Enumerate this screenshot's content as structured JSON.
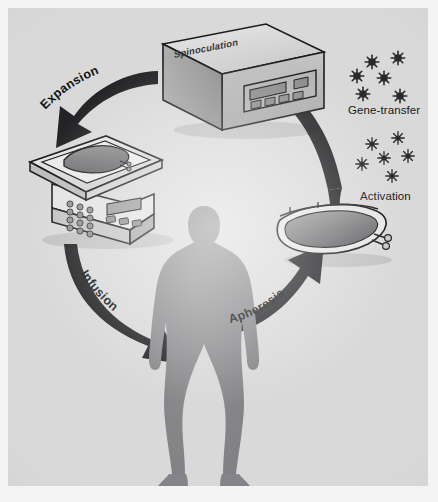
{
  "figure": {
    "background_color": "#d9d9d9",
    "border_color": "#ffffff",
    "ink_color": "#1a1a1c",
    "silhouette_color": "#8a8a8c"
  },
  "steps": [
    {
      "id": "apheresis",
      "label": "Apheresis",
      "order": 1
    },
    {
      "id": "activation",
      "label": "Activation",
      "order": 2
    },
    {
      "id": "gene-transfer",
      "label": "Gene-transfer",
      "order": 3
    },
    {
      "id": "spinoculation",
      "label": "Spinoculation",
      "order": 4
    },
    {
      "id": "expansion",
      "label": "Expansion",
      "order": 5
    },
    {
      "id": "infusion",
      "label": "Infusion",
      "order": 6
    }
  ],
  "labels": {
    "expansion": "Expansion",
    "spinoculation": "Spinoculation",
    "gene_transfer": "Gene-transfer",
    "activation": "Activation",
    "apheresis": "Apheresis",
    "infusion": "Infusion"
  },
  "objects": {
    "centrifuge": {
      "name": "spinoculation-centrifuge",
      "top_label": "Spinoculation",
      "button_count": 4
    },
    "rocker": {
      "name": "rocking-bioreactor",
      "keypad_rows": 4,
      "keypad_cols": 3,
      "button_count": 3
    },
    "culture_bag": {
      "name": "cell-culture-bag",
      "port_count": 2
    },
    "patient": {
      "name": "patient-silhouette"
    }
  },
  "particles": {
    "gene_transfer": {
      "name": "viral-vector-particles",
      "count": 6,
      "glyph": "virus-icon"
    },
    "activation": {
      "name": "activation-bead-particles",
      "count": 6,
      "glyph": "bead-star-icon"
    }
  },
  "arrows": [
    {
      "id": "arrow-apheresis",
      "from": "patient",
      "to": "culture-bag",
      "label": "Apheresis"
    },
    {
      "id": "arrow-gene-transfer",
      "from": "culture-bag",
      "to": "centrifuge",
      "label": ""
    },
    {
      "id": "arrow-expansion",
      "from": "centrifuge",
      "to": "rocker",
      "label": "Expansion"
    },
    {
      "id": "arrow-infusion",
      "from": "rocker",
      "to": "patient",
      "label": "Infusion"
    }
  ]
}
